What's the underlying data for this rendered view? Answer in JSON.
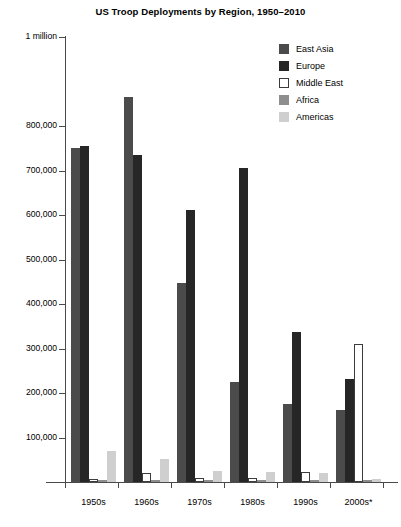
{
  "chart_data": {
    "type": "bar",
    "title": "US Troop Deployments by Region, 1950–2010",
    "xlabel": "",
    "ylabel": "",
    "ylim": [
      0,
      1000000
    ],
    "grid": false,
    "legend_position": "top-right",
    "categories": [
      "1950s",
      "1960s",
      "1970s",
      "1980s",
      "1990s",
      "2000s*"
    ],
    "ytick_values": [
      1000000,
      800000,
      700000,
      600000,
      500000,
      400000,
      300000,
      200000,
      100000
    ],
    "ytick_labels": [
      "1 million",
      "800,000",
      "700,000",
      "600,000",
      "500,000",
      "400,000",
      "300,000",
      "200,000",
      "100,000"
    ],
    "series": [
      {
        "name": "East Asia",
        "color": "#4b4b4b",
        "values": [
          750000,
          865000,
          448000,
          225000,
          176000,
          162000
        ]
      },
      {
        "name": "Europe",
        "color": "#262626",
        "values": [
          756000,
          735000,
          612000,
          705000,
          338000,
          232000
        ]
      },
      {
        "name": "Middle East",
        "color": "#ffffff",
        "values": [
          7000,
          20000,
          9000,
          10000,
          22000,
          311000
        ]
      },
      {
        "name": "Africa",
        "color": "#8e8e8e",
        "values": [
          4000,
          5000,
          4000,
          4000,
          5000,
          4000
        ]
      },
      {
        "name": "Americas",
        "color": "#cfcfcf",
        "values": [
          70000,
          52000,
          24000,
          22000,
          20000,
          6000
        ]
      }
    ],
    "footnote_marker": "*"
  },
  "legend": {
    "items": [
      {
        "label": "East Asia"
      },
      {
        "label": "Europe"
      },
      {
        "label": "Middle East"
      },
      {
        "label": "Africa"
      },
      {
        "label": "Americas"
      }
    ]
  }
}
